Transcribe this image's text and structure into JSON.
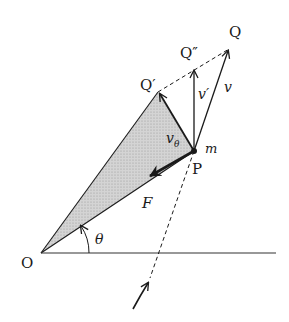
{
  "diagram": {
    "type": "physics-vector-diagram",
    "labels": {
      "origin": "O",
      "point_p": "P",
      "mass": "m",
      "q": "Q",
      "q_prime": "Q′",
      "q_double_prime": "Q″",
      "velocity": "v",
      "velocity_prime": "v′",
      "v_theta": "v",
      "v_theta_sub": "θ",
      "force": "F",
      "angle": "θ"
    },
    "colors": {
      "shaded_area": "#c8c8c8",
      "line": "#1a1a1a"
    }
  }
}
